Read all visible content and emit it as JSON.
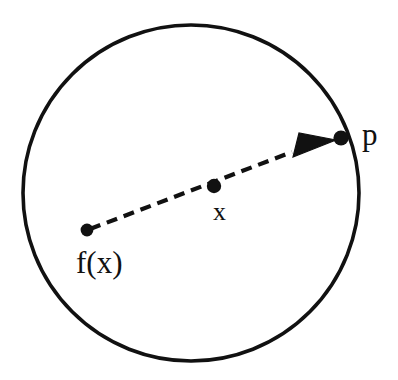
{
  "figure": {
    "background_color": "#ffffff",
    "ink_color": "#111111",
    "width": 398,
    "height": 380
  },
  "circle": {
    "name": "disk-boundary",
    "center_x": 191,
    "center_y": 193,
    "radius": 168,
    "stroke_width": 3.6,
    "stroke_color": "#111111",
    "fill": "none"
  },
  "points": [
    {
      "id": "fx",
      "label": "f(x)",
      "dot_x": 87,
      "dot_y": 230,
      "dot_radius": 6.4,
      "label_x": 76,
      "label_y": 273,
      "label_font_size": 31,
      "label_anchor": "start"
    },
    {
      "id": "x",
      "label": "x",
      "dot_x": 214,
      "dot_y": 186,
      "dot_radius": 7.2,
      "label_x": 213,
      "label_y": 220,
      "label_font_size": 26,
      "label_anchor": "start"
    },
    {
      "id": "p",
      "label": "p",
      "dot_x": 341,
      "dot_y": 138,
      "dot_radius": 7.6,
      "label_x": 362,
      "label_y": 145,
      "label_font_size": 31,
      "label_anchor": "start"
    }
  ],
  "arrow": {
    "name": "dashed-arrow-fx-to-p",
    "start_x": 90,
    "start_y": 229,
    "end_x": 338,
    "end_y": 141,
    "stroke_width": 4.2,
    "stroke_color": "#111111",
    "dash_length": 11,
    "dash_gap": 7,
    "dash_array": "11 7",
    "head_tip_x": 336,
    "head_tip_y": 140,
    "head_base_x": 293,
    "head_base_y": 157,
    "head_back_x": 299,
    "head_back_y": 133,
    "head_fill": "#111111",
    "line_stop_x": 292,
    "line_stop_y": 152
  },
  "stats": {
    "point_count": 3,
    "arrow_count": 1,
    "shape_count": 1
  }
}
